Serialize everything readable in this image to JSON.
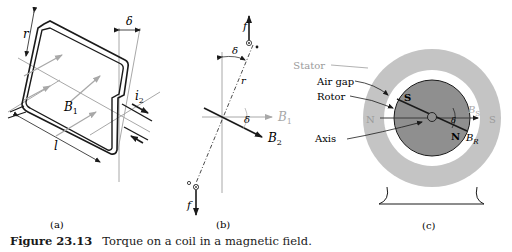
{
  "figure": {
    "number": "Figure 23.13",
    "caption": "Torque on a coil in a magnetic field."
  },
  "panels": {
    "a": {
      "label": "(a)",
      "symbols": {
        "r": "r",
        "delta": "δ",
        "B1": "B",
        "B1_sub": "1",
        "i2": "i",
        "i2_sub": "2",
        "l": "l"
      }
    },
    "b": {
      "label": "(b)",
      "symbols": {
        "f_top": "f",
        "f_bottom": "f",
        "delta_top": "δ",
        "r": "r",
        "delta_mid": "δ",
        "B1": "B",
        "B1_sub": "1",
        "B2": "B",
        "B2_sub": "2"
      }
    },
    "c": {
      "label": "(c)",
      "callouts": [
        "Stator",
        "Air gap",
        "Rotor",
        "Axis"
      ],
      "poles": {
        "stator_left": "N",
        "stator_right": "S",
        "rotor_top": "S",
        "rotor_bottom": "N"
      },
      "symbols": {
        "BS": "B",
        "BS_sub": "S",
        "BR": "B",
        "BR_sub": "R",
        "delta": "δ"
      }
    }
  },
  "colors": {
    "ink": "#1a1a1a",
    "gray_line": "#a8a8a8",
    "stator_fill": "#c4c4c4",
    "rotor_fill": "#8f8f8f",
    "airgap_fill": "#ffffff"
  }
}
